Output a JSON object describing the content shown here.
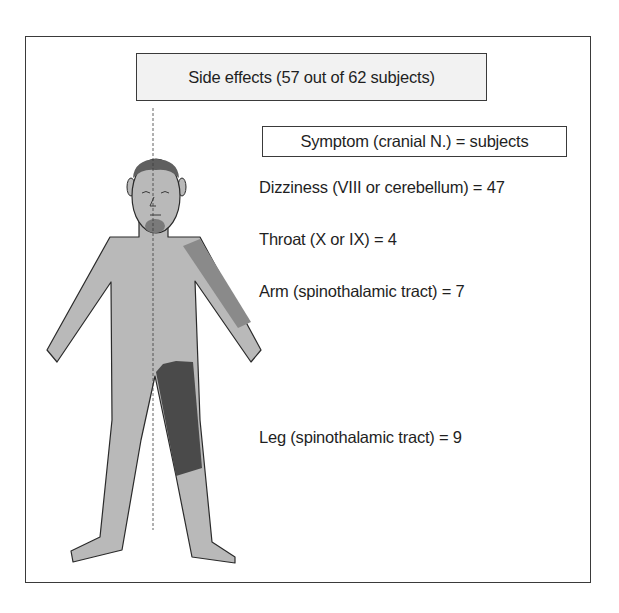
{
  "diagram": {
    "title": "Side effects (57 out of 62 subjects)",
    "legend_header": "Symptom (cranial N.) = subjects",
    "items": [
      {
        "label": "Dizziness (VIII or cerebellum) = 47",
        "symptom": "Dizziness",
        "nerve": "VIII or cerebellum",
        "subjects": 47,
        "body_region": "head",
        "shade": "#5f5f5f"
      },
      {
        "label": "Throat (X or IX) = 4",
        "symptom": "Throat",
        "nerve": "X or IX",
        "subjects": 4,
        "body_region": "throat",
        "shade": "#7a7a7a"
      },
      {
        "label": "Arm (spinothalamic tract) = 7",
        "symptom": "Arm",
        "nerve": "spinothalamic tract",
        "subjects": 7,
        "body_region": "left-arm-of-figure (viewer right)",
        "shade": "#8a8a8a"
      },
      {
        "label": "Leg (spinothalamic tract) = 9",
        "symptom": "Leg",
        "nerve": "spinothalamic tract",
        "subjects": 9,
        "body_region": "left-leg-of-figure (viewer right)",
        "shade": "#4a4a4a"
      }
    ],
    "colors": {
      "body": "#b9b9b9",
      "outline": "#2a2a2a",
      "title_bg": "#f2f2f2"
    }
  }
}
